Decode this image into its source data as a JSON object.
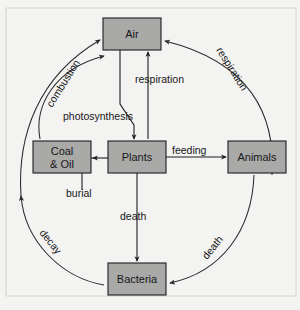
{
  "diagram": {
    "background_color": "#f3f3f1",
    "node_fill_color": "#a9a9a7",
    "line_color": "#1d1d1f",
    "nodes": [
      {
        "id": "air",
        "label": "Air",
        "x": 103,
        "y": 18,
        "w": 58,
        "h": 32
      },
      {
        "id": "coal-oil",
        "label_line1": "Coal",
        "label_line2": "& Oil",
        "x": 33,
        "y": 141,
        "w": 58,
        "h": 32
      },
      {
        "id": "plants",
        "label": "Plants",
        "x": 108,
        "y": 141,
        "w": 58,
        "h": 32
      },
      {
        "id": "animals",
        "label": "Animals",
        "x": 228,
        "y": 141,
        "w": 58,
        "h": 32
      },
      {
        "id": "bacteria",
        "label": "Bacteria",
        "x": 108,
        "y": 263,
        "w": 58,
        "h": 32
      }
    ],
    "edges": [
      {
        "id": "photosynthesis",
        "label": "photosynthesis",
        "from": "air",
        "to": "plants",
        "style": "straight",
        "rotation": 0
      },
      {
        "id": "respiration-center",
        "label": "respiration",
        "from": "plants",
        "to": "air",
        "style": "straight",
        "rotation": 0
      },
      {
        "id": "burial",
        "label": "burial",
        "from": "plants",
        "to": "coal-oil",
        "style": "straight",
        "rotation": 0
      },
      {
        "id": "feeding",
        "label": "feeding",
        "from": "plants",
        "to": "animals",
        "style": "straight",
        "rotation": 0
      },
      {
        "id": "death-center",
        "label": "death",
        "from": "plants",
        "to": "bacteria",
        "style": "straight",
        "rotation": 0
      },
      {
        "id": "combustion",
        "label": "combustion",
        "from": "coal-oil",
        "to": "air",
        "style": "arc",
        "rotation": -58
      },
      {
        "id": "respiration-right",
        "label": "respiration",
        "from": "animals",
        "to": "air",
        "style": "arc",
        "rotation": 58
      },
      {
        "id": "death-right",
        "label": "death",
        "from": "animals",
        "to": "bacteria",
        "style": "arc",
        "rotation": -51
      },
      {
        "id": "decay",
        "label": "decay",
        "from": "bacteria",
        "to": "coal-oil",
        "style": "arc",
        "rotation": 51
      }
    ]
  }
}
